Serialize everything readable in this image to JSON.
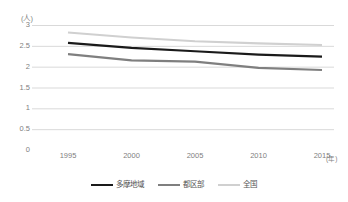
{
  "chart_data": {
    "type": "line",
    "title": "",
    "xlabel": "(年)",
    "ylabel": "(人)",
    "x": [
      1995,
      2000,
      2005,
      2010,
      2015
    ],
    "x_tick_labels": [
      "1995",
      "2000",
      "2005",
      "2010",
      "2015"
    ],
    "y_tick_labels": [
      "3",
      "2.5",
      "2",
      "1.5",
      "1",
      "0.5",
      "0"
    ],
    "y_ticks": [
      3,
      2.5,
      2,
      1.5,
      1,
      0.5,
      0
    ],
    "ylim": [
      0,
      3
    ],
    "grid": true,
    "grid_axis": "y",
    "legend_position": "bottom",
    "series": [
      {
        "name": "多摩地域",
        "color": "#1a1a1a",
        "values": [
          2.57,
          2.45,
          2.37,
          2.29,
          2.24
        ]
      },
      {
        "name": "都区部",
        "color": "#7f7f7f",
        "values": [
          2.3,
          2.15,
          2.12,
          1.97,
          1.92
        ]
      },
      {
        "name": "全国",
        "color": "#d0d0d0",
        "values": [
          2.82,
          2.7,
          2.61,
          2.56,
          2.52
        ]
      }
    ]
  },
  "axes": {
    "y_unit": "(人)",
    "x_unit": "(年)"
  },
  "colors": {
    "grid": "#d9d9d9",
    "axis_text": "#808080",
    "legend_text": "#555555",
    "background": "#ffffff"
  }
}
